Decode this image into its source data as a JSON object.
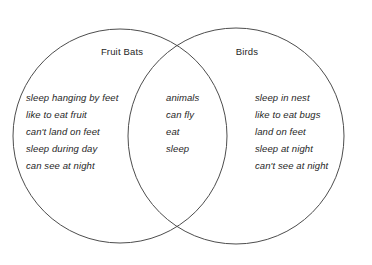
{
  "diagram": {
    "type": "venn-diagram",
    "sets": 2,
    "background_color": "#ffffff",
    "stroke_color": "#4d4d4d",
    "text_color": "#262626",
    "left": {
      "title": "Fruit Bats",
      "items": [
        "sleep hanging by feet",
        "like to eat fruit",
        "can't land on feet",
        "sleep during day",
        "can see at night"
      ]
    },
    "center": {
      "title": "",
      "items": [
        "animals",
        "can fly",
        "eat",
        "sleep"
      ]
    },
    "right": {
      "title": "Birds",
      "items": [
        "sleep in nest",
        "like to eat bugs",
        "land on feet",
        "sleep at night",
        "can't see at night"
      ]
    },
    "geometry": {
      "left_circle": {
        "cx": 120,
        "cy": 136,
        "r": 107
      },
      "right_circle": {
        "cx": 236,
        "cy": 136,
        "r": 108
      }
    }
  }
}
